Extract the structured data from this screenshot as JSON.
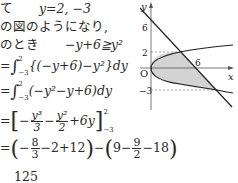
{
  "text": {
    "line1_prefix": "て",
    "line1_eq": "y=2,  −3",
    "line2": "の図のようになり,",
    "line3_prefix": "のとき",
    "line3_ineq": "−y+6≧y²",
    "line4_eq_start": "=",
    "line4_integrand": "{(−y+6)−y²}dy",
    "line5_eq_start": "=",
    "line5_integrand": "(−y²−y+6)dy",
    "int_upper": "2",
    "int_lower": "−3",
    "line6_eq_start": "=",
    "line6_frac1_num": "y³",
    "line6_frac1_den": "3",
    "line6_frac2_num": "y²",
    "line6_frac2_den": "2",
    "line6_term3": "+6y",
    "line6_minus1": "−",
    "line6_minus2": "−",
    "line7_eq_start": "=",
    "line7_part1_a": "−",
    "line7_frac1_num": "8",
    "line7_frac1_den": "3",
    "line7_part1_b": "−2+12",
    "line7_mid": "−",
    "line7_part2_a": "9−",
    "line7_frac2_num": "9",
    "line7_frac2_den": "2",
    "line7_part2_b": "−18",
    "line8_num": "125"
  },
  "graph": {
    "axis_x_label": "x",
    "axis_y_label": "y",
    "origin_label": "O",
    "y_ticks": [
      "6",
      "2",
      "−3"
    ],
    "x_ticks": [
      "6"
    ],
    "curves": [
      "x = y²",
      "y = −x + 6"
    ],
    "intersections": [
      [
        4,
        2
      ],
      [
        9,
        -3
      ]
    ],
    "shade_color": "#d3d3d3",
    "line_color": "#222222",
    "dash_color": "#888888"
  }
}
